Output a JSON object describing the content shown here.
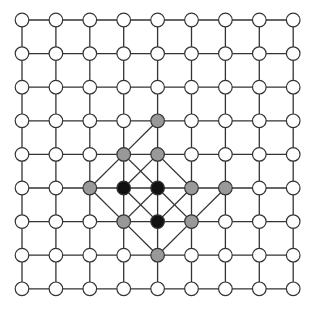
{
  "diagram": {
    "type": "lattice-grid",
    "columns": 9,
    "rows": 9,
    "origin": {
      "x": 22,
      "y": 20
    },
    "spacing": {
      "x": 33.9,
      "y": 33.6
    },
    "node_radius": 6.8,
    "colors": {
      "line": "#333333",
      "empty": "#ffffff",
      "gray": "#999999",
      "black": "#111111"
    },
    "highlighted_nodes": [
      {
        "col": 4,
        "row": 3,
        "state": "gray"
      },
      {
        "col": 3,
        "row": 4,
        "state": "gray"
      },
      {
        "col": 4,
        "row": 4,
        "state": "gray"
      },
      {
        "col": 2,
        "row": 5,
        "state": "gray"
      },
      {
        "col": 3,
        "row": 5,
        "state": "black"
      },
      {
        "col": 4,
        "row": 5,
        "state": "black"
      },
      {
        "col": 5,
        "row": 5,
        "state": "gray"
      },
      {
        "col": 6,
        "row": 5,
        "state": "gray"
      },
      {
        "col": 3,
        "row": 6,
        "state": "gray"
      },
      {
        "col": 4,
        "row": 6,
        "state": "black"
      },
      {
        "col": 5,
        "row": 6,
        "state": "gray"
      },
      {
        "col": 4,
        "row": 7,
        "state": "gray"
      }
    ],
    "diagonal_edges": [
      [
        [
          4,
          3
        ],
        [
          3,
          4
        ]
      ],
      [
        [
          3,
          4
        ],
        [
          2,
          5
        ]
      ],
      [
        [
          3,
          4
        ],
        [
          4,
          5
        ]
      ],
      [
        [
          4,
          4
        ],
        [
          3,
          5
        ]
      ],
      [
        [
          4,
          4
        ],
        [
          5,
          5
        ]
      ],
      [
        [
          2,
          5
        ],
        [
          3,
          6
        ]
      ],
      [
        [
          3,
          5
        ],
        [
          4,
          6
        ]
      ],
      [
        [
          4,
          5
        ],
        [
          3,
          6
        ]
      ],
      [
        [
          4,
          5
        ],
        [
          5,
          6
        ]
      ],
      [
        [
          5,
          5
        ],
        [
          4,
          6
        ]
      ],
      [
        [
          6,
          5
        ],
        [
          5,
          6
        ]
      ],
      [
        [
          3,
          6
        ],
        [
          4,
          7
        ]
      ],
      [
        [
          5,
          6
        ],
        [
          4,
          7
        ]
      ]
    ]
  }
}
